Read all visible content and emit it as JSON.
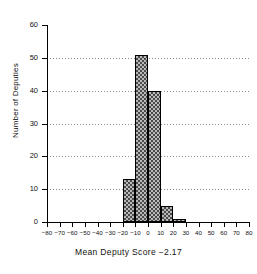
{
  "chart_data": {
    "type": "bar",
    "title": "",
    "subtitle": "",
    "xlabel": "Mean Deputy Score −2.17",
    "ylabel": "Number of Deputies",
    "xlim": [
      -80,
      80
    ],
    "ylim": [
      0,
      60
    ],
    "xticks": [
      -80,
      -70,
      -60,
      -50,
      -40,
      -30,
      -20,
      -10,
      0,
      10,
      20,
      30,
      40,
      50,
      60,
      70,
      80
    ],
    "xtick_labels": [
      "−80",
      "−70",
      "−60",
      "−50",
      "−40",
      "−30",
      "−20",
      "−10",
      "0",
      "10",
      "20",
      "30",
      "40",
      "50",
      "60",
      "70",
      "80"
    ],
    "yticks": [
      0,
      10,
      20,
      30,
      40,
      50,
      60
    ],
    "ytick_labels": [
      "0",
      "10",
      "20",
      "30",
      "40",
      "50",
      "60"
    ],
    "grid": "horizontal-dotted",
    "legend": null,
    "bin_width": 10,
    "bins": [
      {
        "left": -80,
        "right": -70,
        "value": 0
      },
      {
        "left": -70,
        "right": -60,
        "value": 0
      },
      {
        "left": -60,
        "right": -50,
        "value": 0
      },
      {
        "left": -50,
        "right": -40,
        "value": 0
      },
      {
        "left": -40,
        "right": -30,
        "value": 0
      },
      {
        "left": -30,
        "right": -20,
        "value": 0
      },
      {
        "left": -20,
        "right": -10,
        "value": 13
      },
      {
        "left": -10,
        "right": 0,
        "value": 51
      },
      {
        "left": 0,
        "right": 10,
        "value": 40
      },
      {
        "left": 10,
        "right": 20,
        "value": 5
      },
      {
        "left": 20,
        "right": 30,
        "value": 1
      },
      {
        "left": 30,
        "right": 40,
        "value": 0
      },
      {
        "left": 40,
        "right": 50,
        "value": 0
      },
      {
        "left": 50,
        "right": 60,
        "value": 0
      },
      {
        "left": 60,
        "right": 70,
        "value": 0
      },
      {
        "left": 70,
        "right": 80,
        "value": 0
      }
    ],
    "categories": [
      "-20 to -10",
      "-10 to 0",
      "0 to 10",
      "10 to 20",
      "20 to 30"
    ],
    "values": [
      13,
      51,
      40,
      5,
      1
    ],
    "annotations": [
      "Mean Deputy Score −2.17"
    ],
    "colors": {
      "bar_fill": "#b9b9b9",
      "bar_hatch": "#4a4a4a",
      "bar_edge": "#000000",
      "axis": "#000000",
      "grid": "#8a8a8a",
      "background": "#ffffff"
    }
  }
}
